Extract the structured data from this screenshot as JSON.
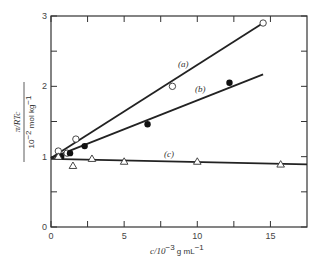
{
  "chart_data": {
    "type": "scatter",
    "title": "",
    "xlabel": "c/10^-3 g mL^-1",
    "ylabel": "(π/RTc) / (10^-2 mol kg^-1)",
    "xlim": [
      0,
      17.5
    ],
    "ylim": [
      0,
      3
    ],
    "x_ticks": [
      0,
      2.5,
      5,
      7.5,
      10,
      12.5,
      15
    ],
    "x_tick_labels": [
      "0",
      "5",
      "10",
      "15"
    ],
    "y_ticks": [
      0,
      0.5,
      1,
      1.5,
      2,
      2.5,
      3
    ],
    "y_tick_labels": [
      "0",
      "1",
      "2",
      "3"
    ],
    "grid": false,
    "legend": "none (inline labels)",
    "series": [
      {
        "name": "(a)",
        "marker": "open-circle",
        "x": [
          0.5,
          1.1,
          1.7,
          8.3,
          14.5
        ],
        "y": [
          1.08,
          1.05,
          1.25,
          2.0,
          2.9
        ],
        "fit_line": {
          "x": [
            0,
            14.5
          ],
          "y": [
            0.98,
            2.9
          ]
        }
      },
      {
        "name": "(b)",
        "marker": "filled-circle",
        "x": [
          0.7,
          1.3,
          2.3,
          6.6,
          12.2
        ],
        "y": [
          1.0,
          1.05,
          1.15,
          1.46,
          2.05
        ],
        "fit_line": {
          "x": [
            0,
            14.5
          ],
          "y": [
            0.98,
            2.17
          ]
        }
      },
      {
        "name": "(c)",
        "marker": "open-triangle",
        "x": [
          0.5,
          1.5,
          2.8,
          5.0,
          10.0,
          15.7
        ],
        "y": [
          1.0,
          0.87,
          0.97,
          0.93,
          0.93,
          0.89
        ],
        "fit_line": {
          "x": [
            0,
            17.5
          ],
          "y": [
            0.97,
            0.89
          ]
        }
      }
    ]
  },
  "labels": {
    "series_a": "(a)",
    "series_b": "(b)",
    "series_c": "(c)",
    "x_axis": "c/10",
    "x_axis_exp": "−3",
    "x_axis_unit": " g mL",
    "x_axis_unit_exp": "−1",
    "y_axis_num": "π/RTc",
    "y_axis_den": "10",
    "y_axis_den_exp": "−2",
    "y_axis_den_unit": " mol kg",
    "y_axis_den_unit_exp": "−1"
  }
}
